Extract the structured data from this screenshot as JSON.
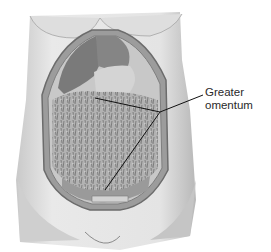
{
  "figure": {
    "labels": [
      {
        "line1": "Greater",
        "line2": "omentum"
      }
    ],
    "colors": {
      "skin_light": "#e6e6e6",
      "skin_mid": "#bdbdbd",
      "skin_dark": "#8a8a8a",
      "organ": "#7a7a7a",
      "omentum": "#a8a8a8",
      "leader_line": "#111111"
    }
  }
}
